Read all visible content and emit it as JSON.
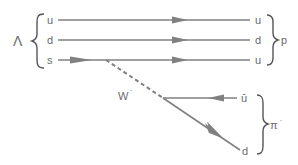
{
  "diagram": {
    "initial_particle": {
      "label": "Λ",
      "quarks": [
        "u",
        "d",
        "s"
      ]
    },
    "final_baryon": {
      "label": "p",
      "quarks": [
        "u",
        "d",
        "u"
      ]
    },
    "boson": {
      "label": "W",
      "charge": "-"
    },
    "final_meson": {
      "label": "π",
      "charge": "-",
      "quarks": [
        "ū",
        "d"
      ]
    },
    "colors": {
      "line": "#808080",
      "text": "#6b6b6b",
      "brace": "#555555"
    }
  }
}
